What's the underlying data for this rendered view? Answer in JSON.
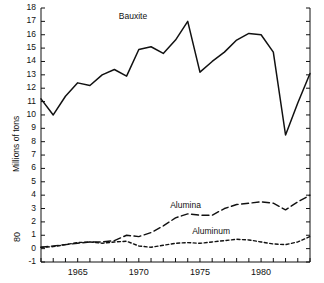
{
  "chart_data": {
    "type": "line",
    "title": "",
    "xlabel": "",
    "ylabel": "Millions of tons",
    "figure_number": "80",
    "xlim": [
      1962,
      1984
    ],
    "ylim": [
      -1,
      18
    ],
    "grid": false,
    "legend_position": "inline-annotations",
    "xticks": [
      1965,
      1970,
      1975,
      1980
    ],
    "xtick_labels": [
      "1965",
      "1970",
      "1975",
      "1980"
    ],
    "yticks": [
      -1,
      0,
      1,
      2,
      3,
      4,
      5,
      6,
      7,
      8,
      9,
      10,
      11,
      12,
      13,
      14,
      15,
      16,
      17,
      18
    ],
    "ytick_labels": [
      "-1",
      "0",
      "1",
      "2",
      "3",
      "4",
      "5",
      "6",
      "7",
      "8",
      "9",
      "10",
      "11",
      "12",
      "13",
      "14",
      "15",
      "16",
      "17",
      "18"
    ],
    "x": [
      1962,
      1963,
      1964,
      1965,
      1966,
      1967,
      1968,
      1969,
      1970,
      1971,
      1972,
      1973,
      1974,
      1975,
      1976,
      1977,
      1978,
      1979,
      1980,
      1981,
      1982,
      1983,
      1984
    ],
    "series": [
      {
        "name": "Bauxite",
        "style": "solid",
        "label": "Bauxite",
        "values": [
          11.2,
          10.0,
          11.4,
          12.4,
          12.2,
          13.0,
          13.4,
          12.9,
          14.9,
          15.1,
          14.6,
          15.6,
          17.0,
          13.2,
          14.0,
          14.7,
          15.6,
          16.1,
          16.0,
          14.7,
          8.5,
          10.9,
          13.1
        ]
      },
      {
        "name": "Alumina",
        "style": "long-dash",
        "label": "Alumina",
        "values": [
          0.1,
          0.2,
          0.3,
          0.4,
          0.5,
          0.5,
          0.6,
          1.0,
          0.9,
          1.2,
          1.7,
          2.3,
          2.6,
          2.5,
          2.5,
          3.0,
          3.3,
          3.4,
          3.5,
          3.4,
          2.9,
          3.5,
          4.0
        ]
      },
      {
        "name": "Aluminum",
        "style": "short-dash",
        "label": "Aluminum",
        "values": [
          0.1,
          0.15,
          0.3,
          0.45,
          0.5,
          0.4,
          0.5,
          0.55,
          0.2,
          0.1,
          0.25,
          0.4,
          0.45,
          0.4,
          0.5,
          0.6,
          0.7,
          0.65,
          0.5,
          0.35,
          0.3,
          0.5,
          0.9
        ]
      }
    ],
    "annotations": [
      {
        "text": "Bauxite",
        "x": 1970.0,
        "y": 17.3
      },
      {
        "text": "Alumina",
        "x": 1974.2,
        "y": 3.2
      },
      {
        "text": "Aluminum",
        "x": 1976.0,
        "y": 1.25
      }
    ]
  }
}
